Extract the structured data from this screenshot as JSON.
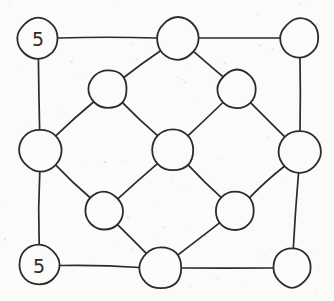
{
  "diagram": {
    "background_color": "#fbfbf9",
    "ink_color": "#2b2b2b",
    "width": 334,
    "height": 301,
    "nodes": [
      {
        "id": "n-top-left",
        "label": "5",
        "cx": 38,
        "cy": 38,
        "r": 20
      },
      {
        "id": "n-top-center",
        "label": "",
        "cx": 178,
        "cy": 38,
        "r": 21
      },
      {
        "id": "n-top-right",
        "label": "",
        "cx": 300,
        "cy": 38,
        "r": 19
      },
      {
        "id": "n-inner-top-left",
        "label": "",
        "cx": 108,
        "cy": 89,
        "r": 19
      },
      {
        "id": "n-inner-top-right",
        "label": "",
        "cx": 237,
        "cy": 89,
        "r": 19
      },
      {
        "id": "n-mid-left",
        "label": "",
        "cx": 40,
        "cy": 150,
        "r": 21
      },
      {
        "id": "n-center",
        "label": "",
        "cx": 173,
        "cy": 150,
        "r": 21
      },
      {
        "id": "n-mid-right",
        "label": "",
        "cx": 300,
        "cy": 152,
        "r": 21
      },
      {
        "id": "n-inner-bot-left",
        "label": "",
        "cx": 104,
        "cy": 211,
        "r": 19
      },
      {
        "id": "n-inner-bot-right",
        "label": "",
        "cx": 235,
        "cy": 211,
        "r": 19
      },
      {
        "id": "n-bot-left",
        "label": "5",
        "cx": 39,
        "cy": 265,
        "r": 20
      },
      {
        "id": "n-bot-center",
        "label": "",
        "cx": 161,
        "cy": 268,
        "r": 21
      },
      {
        "id": "n-bot-right",
        "label": "",
        "cx": 292,
        "cy": 268,
        "r": 19
      }
    ],
    "edges": [
      {
        "from": "n-top-left",
        "to": "n-top-center"
      },
      {
        "from": "n-top-center",
        "to": "n-top-right"
      },
      {
        "from": "n-top-left",
        "to": "n-mid-left"
      },
      {
        "from": "n-top-right",
        "to": "n-mid-right"
      },
      {
        "from": "n-mid-left",
        "to": "n-bot-left"
      },
      {
        "from": "n-mid-right",
        "to": "n-bot-right"
      },
      {
        "from": "n-bot-left",
        "to": "n-bot-center"
      },
      {
        "from": "n-bot-center",
        "to": "n-bot-right"
      },
      {
        "from": "n-top-center",
        "to": "n-inner-top-left"
      },
      {
        "from": "n-top-center",
        "to": "n-inner-top-right"
      },
      {
        "from": "n-inner-top-left",
        "to": "n-mid-left"
      },
      {
        "from": "n-inner-top-left",
        "to": "n-center"
      },
      {
        "from": "n-inner-top-right",
        "to": "n-center"
      },
      {
        "from": "n-inner-top-right",
        "to": "n-mid-right"
      },
      {
        "from": "n-mid-left",
        "to": "n-inner-bot-left"
      },
      {
        "from": "n-center",
        "to": "n-inner-bot-left"
      },
      {
        "from": "n-center",
        "to": "n-inner-bot-right"
      },
      {
        "from": "n-mid-right",
        "to": "n-inner-bot-right"
      },
      {
        "from": "n-inner-bot-left",
        "to": "n-bot-center"
      },
      {
        "from": "n-inner-bot-right",
        "to": "n-bot-center"
      }
    ]
  }
}
